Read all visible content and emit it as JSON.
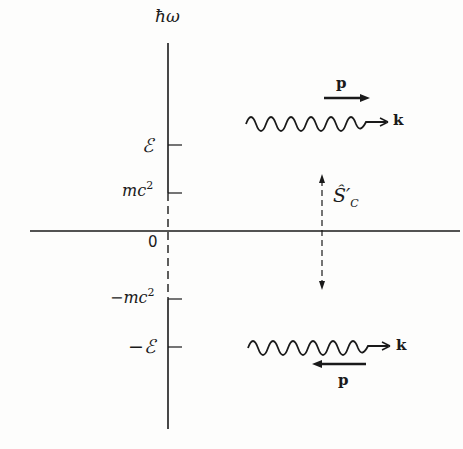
{
  "diagram": {
    "axis": {
      "y_label": "ħω",
      "origin_label": "0"
    },
    "levels": [
      {
        "label": "ℰ",
        "y": 145
      },
      {
        "label": "mc",
        "sup": "2",
        "y": 193
      },
      {
        "label": "−mc",
        "sup": "2",
        "y": 299
      },
      {
        "label": "−ℰ",
        "y": 347
      }
    ],
    "states": {
      "positive": {
        "momentum_label": "p",
        "wavevector_label": "k",
        "momentum_direction": "right"
      },
      "negative": {
        "momentum_label": "p",
        "wavevector_label": "k",
        "momentum_direction": "left"
      }
    },
    "operator": {
      "label": "Ŝ",
      "prime": "′",
      "sub": "C"
    },
    "colors": {
      "ink": "#1a1a1a",
      "background": "#fdfdfc"
    }
  }
}
